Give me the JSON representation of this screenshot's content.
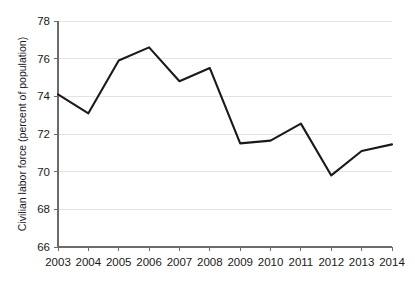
{
  "chart_data": {
    "type": "line",
    "title": "",
    "subtitle": "",
    "xlabel": "",
    "ylabel": "Civilian labor force (percent of population)",
    "categories": [
      "2003",
      "2004",
      "2005",
      "2006",
      "2007",
      "2008",
      "2009",
      "2010",
      "2011",
      "2012",
      "2013",
      "2014"
    ],
    "x": [
      2003,
      2004,
      2005,
      2006,
      2007,
      2008,
      2009,
      2010,
      2011,
      2012,
      2013,
      2014
    ],
    "values": [
      74.1,
      73.1,
      75.9,
      76.6,
      74.8,
      75.5,
      71.5,
      71.65,
      72.55,
      69.8,
      71.1,
      71.45
    ],
    "series": [
      {
        "name": "Civilian labor force",
        "color": "#1a1a1a",
        "values": [
          74.1,
          73.1,
          75.9,
          76.6,
          74.8,
          75.5,
          71.5,
          71.65,
          72.55,
          69.8,
          71.1,
          71.45
        ]
      }
    ],
    "ylim": [
      66,
      78
    ],
    "yticks": [
      66,
      68,
      70,
      72,
      74,
      76,
      78
    ],
    "ytick_labels": [
      "66",
      "68",
      "70",
      "72",
      "74",
      "76",
      "78"
    ],
    "xtick_labels": [
      "2003",
      "2004",
      "2005",
      "2006",
      "2007",
      "2008",
      "2009",
      "2010",
      "2011",
      "2012",
      "2013",
      "2014"
    ],
    "grid": "horizontal",
    "grid_color": "#e3e3e3",
    "legend": "none",
    "background": "#ffffff",
    "line_color": "#1a1a1a",
    "axis_color": "#6b6b6b",
    "annotations": []
  }
}
